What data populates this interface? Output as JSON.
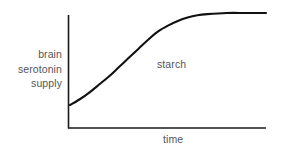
{
  "figure": {
    "background_color": "#ffffff",
    "axis_color": "#1a1a1a",
    "curve_color": "#111111",
    "text_color": "#555555"
  },
  "labels": {
    "y_axis_line1": "brain",
    "y_axis_line2": "serotonin",
    "y_axis_line3": "supply",
    "y_axis_full": "brain serotonin supply",
    "x_axis": "time",
    "curve_annotation": "starch"
  },
  "chart_data": {
    "type": "line",
    "title": "",
    "xlabel": "time",
    "ylabel": "brain serotonin supply",
    "grid": false,
    "legend": false,
    "annotations": [
      {
        "text": "starch",
        "x": 0.55,
        "y": 0.55
      }
    ],
    "xlim": [
      0,
      1
    ],
    "ylim": [
      0,
      1
    ],
    "axis_ticks": {
      "x": [],
      "y": []
    },
    "series": [
      {
        "name": "starch",
        "color": "#111111",
        "x": [
          0.0,
          0.05,
          0.1,
          0.15,
          0.2,
          0.25,
          0.3,
          0.35,
          0.4,
          0.45,
          0.5,
          0.55,
          0.6,
          0.65,
          0.7,
          0.8,
          0.9,
          1.0
        ],
        "y": [
          0.2,
          0.25,
          0.31,
          0.38,
          0.45,
          0.53,
          0.61,
          0.69,
          0.77,
          0.84,
          0.89,
          0.93,
          0.96,
          0.98,
          0.99,
          1.0,
          1.0,
          1.0
        ]
      }
    ]
  },
  "geometry": {
    "axis_origin_x": 68,
    "axis_origin_y": 128,
    "axis_top_y": 15,
    "axis_right_x": 266,
    "curve_start": [
      70,
      105
    ],
    "curve_plateau_y": 13,
    "curve_end_x": 266
  }
}
